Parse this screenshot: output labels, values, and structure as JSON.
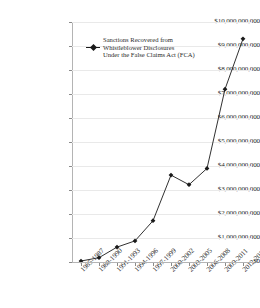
{
  "chart_data": {
    "type": "line",
    "title": "",
    "xlabel": "",
    "ylabel": "",
    "categories": [
      "1985-1987",
      "1988-1990",
      "1991-1993",
      "1994-1996",
      "1997-1999",
      "2000-2002",
      "2003-2005",
      "2006-2008",
      "2009-2011",
      "2012-2014"
    ],
    "series": [
      {
        "name": "Sanctions Recovered from Whistleblower Disclosures Under the False Claims Act (FCA)",
        "values": [
          40000000,
          180000000,
          620000000,
          880000000,
          1720000000,
          3620000000,
          3220000000,
          3900000000,
          7200000000,
          9300000000
        ]
      }
    ],
    "ylim": [
      0,
      10000000000
    ],
    "ytick_values": [
      0,
      1000000000,
      2000000000,
      3000000000,
      4000000000,
      5000000000,
      6000000000,
      7000000000,
      8000000000,
      9000000000,
      10000000000
    ],
    "ytick_labels": [
      "$0",
      "$1,000,000,000",
      "$2,000,000,000",
      "$3,000,000,000",
      "$4,000,000,000",
      "$5,000,000,000",
      "$6,000,000,000",
      "$7,000,000,000",
      "$8,000,000,000",
      "$9,000,000,000",
      "$10,000,000,000"
    ],
    "grid": "horizontal",
    "legend_position": "inside-upper-left",
    "colors": {
      "line": "#1a1a1a",
      "marker": "#1a1a1a",
      "grid": "#e9e9e9",
      "axis": "#b4b4b4",
      "background": "#ffffff",
      "text": "#2b2b2b"
    }
  },
  "legend": {
    "entries": [
      {
        "label_line_1": "Sanctions Recovered from",
        "label_line_2": "Whistleblower Disclosures",
        "label_line_3": "Under the False Claims Act (FCA)"
      }
    ]
  }
}
